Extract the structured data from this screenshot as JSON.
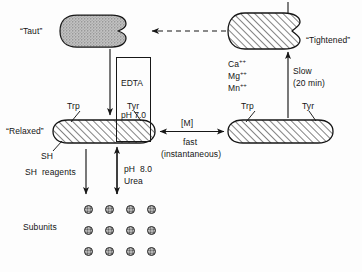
{
  "diagram": {
    "title_states": {
      "taut": "“Taut”",
      "tightened": "“Tightened”",
      "relaxed": "“Relaxed”"
    },
    "residue_labels": {
      "trp_left": "Trp",
      "tyr_left": "Tyr",
      "trp_right": "Trp",
      "tyr_right": "Tyr",
      "sh": "SH"
    },
    "transitions": {
      "edta_line1": "EDTA",
      "edta_line2": "pH 7.0",
      "metal_ca": "Ca",
      "metal_mg": "Mg",
      "metal_mn": "Mn",
      "metal_charge": "++",
      "slow_label": "Slow",
      "slow_time": "(20 min)",
      "m_bracket": "[M]",
      "fast_label": "fast",
      "fast_qualifier": "(instantaneous)",
      "sh_reagents": "SH  reagents",
      "ph_urea_line1": "pH  8.0",
      "ph_urea_line2": "Urea"
    },
    "subunits_label": "Subunits",
    "subunit_grid": {
      "rows": 3,
      "cols": 4,
      "start_x": 84,
      "start_y": 205,
      "step_x": 21,
      "step_y": 21
    },
    "colors": {
      "ink": "#171717",
      "taut_fill": "#b9b9b9",
      "hatch_fill": "#ffffff",
      "subunit_fill": "#8c8c8c",
      "background": "#fdfdfd"
    }
  }
}
